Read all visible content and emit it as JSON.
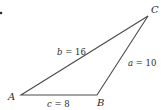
{
  "diagram": {
    "type": "triangle",
    "colors": {
      "stroke": "#4a4a4a",
      "text": "#2a2a2a",
      "background": "#ffffff"
    },
    "vertices": [
      {
        "name": "A",
        "x": 21,
        "y": 95,
        "label_x": 8,
        "label_y": 100
      },
      {
        "name": "B",
        "x": 97,
        "y": 95,
        "label_x": 97,
        "label_y": 106
      },
      {
        "name": "C",
        "x": 148,
        "y": 16,
        "label_x": 151,
        "label_y": 13
      }
    ],
    "sides": [
      {
        "var": "b",
        "eq": " = 16",
        "between": "A-C",
        "label_x": 57,
        "label_y": 55
      },
      {
        "var": "a",
        "eq": " = 10",
        "between": "B-C",
        "label_x": 128,
        "label_y": 66
      },
      {
        "var": "c",
        "eq": " = 8",
        "between": "A-B",
        "label_x": 47,
        "label_y": 107
      }
    ],
    "bullet": {
      "x": 1,
      "y": 13
    }
  }
}
